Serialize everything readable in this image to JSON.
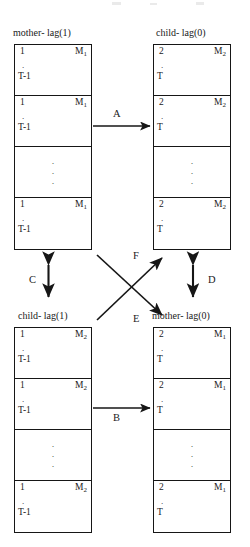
{
  "figure": {
    "title_blocks": {
      "top_left": "mother- lag(1)",
      "top_right": "child- lag(0)",
      "bottom_left": "child- lag(1)",
      "bottom_right": "mother- lag(0)"
    },
    "blocks": [
      {
        "id": "mother-lag-1",
        "caption": "mother- lag(1)",
        "position": "top-left",
        "cells": [
          {
            "kind": "data",
            "start": "1",
            "dot": ".",
            "end": "T-1",
            "right_base": "M",
            "right_sub": "1"
          },
          {
            "kind": "data",
            "start": "1",
            "dot": ".",
            "end": "T-1",
            "right_base": "M",
            "right_sub": "1"
          },
          {
            "kind": "ellipsis",
            "dots": [
              "·",
              "·",
              "·"
            ]
          },
          {
            "kind": "data",
            "start": "1",
            "dot": ".",
            "end": "T-1",
            "right_base": "M",
            "right_sub": "1"
          }
        ]
      },
      {
        "id": "child-lag-0",
        "caption": "child- lag(0)",
        "position": "top-right",
        "cells": [
          {
            "kind": "data",
            "start": "2",
            "dot": ".",
            "end": "T",
            "right_base": "M",
            "right_sub": "2"
          },
          {
            "kind": "data",
            "start": "2",
            "dot": ".",
            "end": "T",
            "right_base": "M",
            "right_sub": "2"
          },
          {
            "kind": "ellipsis",
            "dots": [
              "·",
              "·",
              "·"
            ]
          },
          {
            "kind": "data",
            "start": "2",
            "dot": ".",
            "end": "T",
            "right_base": "M",
            "right_sub": "2"
          }
        ]
      },
      {
        "id": "child-lag-1",
        "caption": "child- lag(1)",
        "position": "bottom-left",
        "cells": [
          {
            "kind": "data",
            "start": "1",
            "dot": ".",
            "end": "T-1",
            "right_base": "M",
            "right_sub": "2"
          },
          {
            "kind": "data",
            "start": "1",
            "dot": ".",
            "end": "T-1",
            "right_base": "M",
            "right_sub": "2"
          },
          {
            "kind": "ellipsis",
            "dots": [
              "·",
              "·",
              "·"
            ]
          },
          {
            "kind": "data",
            "start": "1",
            "dot": ".",
            "end": "T-1",
            "right_base": "M",
            "right_sub": "2"
          }
        ]
      },
      {
        "id": "mother-lag-0",
        "caption": "mother- lag(0)",
        "position": "bottom-right",
        "cells": [
          {
            "kind": "data",
            "start": "2",
            "dot": ".",
            "end": "T",
            "right_base": "M",
            "right_sub": "1"
          },
          {
            "kind": "data",
            "start": "2",
            "dot": ".",
            "end": "T",
            "right_base": "M",
            "right_sub": "1"
          },
          {
            "kind": "ellipsis",
            "dots": [
              "·",
              "·",
              "·"
            ]
          },
          {
            "kind": "data",
            "start": "2",
            "dot": ".",
            "end": "T",
            "right_base": "M",
            "right_sub": "1"
          }
        ]
      }
    ],
    "arrows": [
      {
        "id": "A",
        "label": "A",
        "kind": "single",
        "from": "mother-lag-1",
        "to": "child-lag-0"
      },
      {
        "id": "B",
        "label": "B",
        "kind": "single",
        "from": "child-lag-1",
        "to": "mother-lag-0"
      },
      {
        "id": "C",
        "label": "C",
        "kind": "double",
        "from": "mother-lag-1",
        "to": "child-lag-1"
      },
      {
        "id": "D",
        "label": "D",
        "kind": "double",
        "from": "child-lag-0",
        "to": "mother-lag-0"
      },
      {
        "id": "E",
        "label": "E",
        "kind": "single",
        "from": "mother-lag-1",
        "to": "mother-lag-0"
      },
      {
        "id": "F",
        "label": "F",
        "kind": "single",
        "from": "child-lag-1",
        "to": "child-lag-0"
      }
    ],
    "colors": {
      "ink": "#161616",
      "background": "#ffffff"
    }
  }
}
